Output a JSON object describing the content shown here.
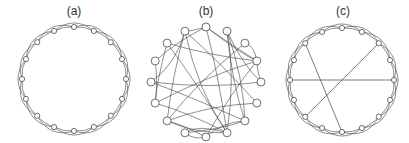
{
  "panels": [
    {
      "id": "a",
      "label": "(a)",
      "type": "regular-ring-lattice",
      "n_nodes": 16,
      "k": 4,
      "center": [
        74,
        79
      ],
      "radius": 52,
      "label_x": 74
    },
    {
      "id": "b",
      "label": "(b)",
      "type": "random-graph",
      "n_nodes": 16,
      "center": [
        206,
        82
      ],
      "radius": 55,
      "label_x": 206
    },
    {
      "id": "c",
      "label": "(c)",
      "type": "small-world",
      "n_nodes": 16,
      "k": 4,
      "center": [
        342,
        80
      ],
      "radius": 52,
      "label_x": 343,
      "shortcuts": [
        [
          12,
          4
        ],
        [
          14,
          8
        ],
        [
          2,
          10
        ]
      ]
    }
  ],
  "colors": {
    "edge": "#444444",
    "node_stroke": "#333333",
    "node_fill": "#ffffff",
    "label": "#333333"
  }
}
